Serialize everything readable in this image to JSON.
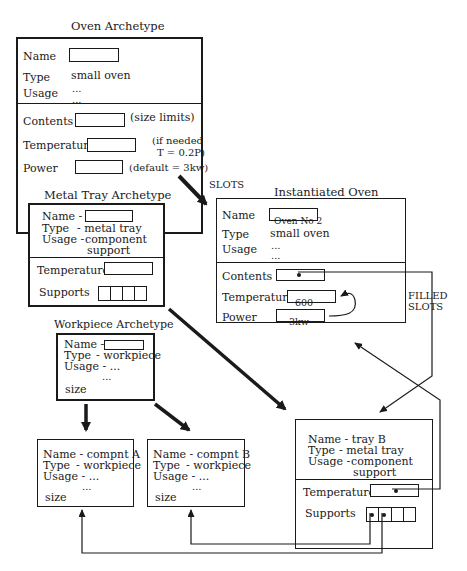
{
  "oven_archetype": {
    "title": "Oven Archetype",
    "header": {
      "name_label": "Name",
      "type_label": "Type",
      "type_value": "small oven",
      "usage_label": "Usage",
      "usage_value_1": "...",
      "usage_value_2": "..."
    },
    "slots": {
      "contents_label": "Contents",
      "contents_note": "(size limits)",
      "temperature_label": "Temperature",
      "temperature_note_1": "(if needed",
      "temperature_note_2": "T = 0.2P)",
      "power_label": "Power",
      "power_note": "(default = 3kw)"
    }
  },
  "slots_annotation": "SLOTS",
  "metal_tray_archetype": {
    "title": "Metal Tray Archetype",
    "name_label": "Name  -",
    "type_label": "Type",
    "type_value": "-  metal tray",
    "usage_label": "Usage -",
    "usage_value_1": "component",
    "usage_value_2": "support",
    "temperature_label": "Temperature",
    "supports_label": "Supports",
    "supports_cells": 4
  },
  "instantiated_oven": {
    "title": "Instantiated Oven",
    "name_label": "Name",
    "name_value": "Oven No 2",
    "type_label": "Type",
    "type_value": "small oven",
    "usage_label": "Usage",
    "usage_value_1": "...",
    "usage_value_2": "...",
    "contents_label": "Contents",
    "temperature_label": "Temperature",
    "temperature_value": "600",
    "power_label": "Power",
    "power_value": "3kw"
  },
  "filled_slots_annotation": {
    "line1": "FILLED",
    "line2": "SLOTS"
  },
  "workpiece_archetype": {
    "title": "Workpiece Archetype",
    "name_label": "Name -",
    "type_label": "Type",
    "type_value": "- workpiece",
    "usage_label": "Usage - ...",
    "usage_value_2": "...",
    "size_label": "size"
  },
  "component_a": {
    "name_line": "Name  - compnt A",
    "type_label": "Type",
    "type_value": "- workpiece",
    "usage_line": "Usage - ...",
    "usage_value_2": "...",
    "size_label": "size"
  },
  "component_b": {
    "name_line": "Name - compnt B",
    "type_label": "Type",
    "type_value": "- workpiece",
    "usage_line": "Usage - ...",
    "usage_value_2": "...",
    "size_label": "size"
  },
  "tray_b": {
    "name_line": "Name  -  tray B",
    "type_label": "Type",
    "type_value": "-  metal tray",
    "usage_label": "Usage -",
    "usage_value_1": "component",
    "usage_value_2": "support",
    "temperature_label": "Temperature",
    "supports_label": "Supports",
    "supports_cells": 4
  }
}
